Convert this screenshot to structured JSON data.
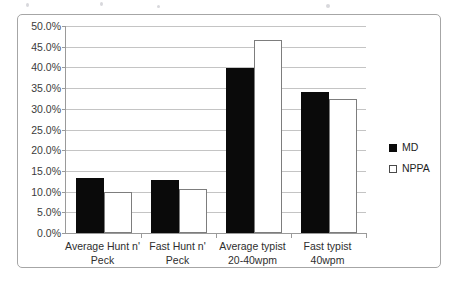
{
  "chart_data": {
    "type": "bar",
    "title": "",
    "subtitle": "",
    "xlabel": "",
    "ylabel": "",
    "ylim": [
      0,
      0.5
    ],
    "grid": true,
    "legend_position": "right",
    "y_tick_labels": [
      "50.0%",
      "45.0%",
      "40.0%",
      "35.0%",
      "30.0%",
      "25.0%",
      "20.0%",
      "15.0%",
      "10.0%",
      "5.0%",
      "0.0%"
    ],
    "y_tick_values": [
      0.5,
      0.45,
      0.4,
      0.35,
      0.3,
      0.25,
      0.2,
      0.15,
      0.1,
      0.05,
      0.0
    ],
    "categories": [
      "Average Hunt n' Peck",
      "Fast Hunt n' Peck",
      "Average typist 20-40wpm",
      "Fast typist 40wpm"
    ],
    "category_lines": [
      [
        "Average Hunt n'",
        "Peck"
      ],
      [
        "Fast Hunt n'",
        "Peck"
      ],
      [
        "Average typist",
        "20-40wpm"
      ],
      [
        "Fast typist",
        "40wpm"
      ]
    ],
    "series": [
      {
        "name": "MD",
        "color": "#0a0a0a",
        "values": [
          0.133,
          0.127,
          0.398,
          0.34
        ]
      },
      {
        "name": "NPPA",
        "color": "#ffffff",
        "values": [
          0.1,
          0.107,
          0.465,
          0.323
        ]
      }
    ]
  },
  "legend": {
    "items": [
      {
        "label": "MD"
      },
      {
        "label": "NPPA"
      }
    ]
  }
}
